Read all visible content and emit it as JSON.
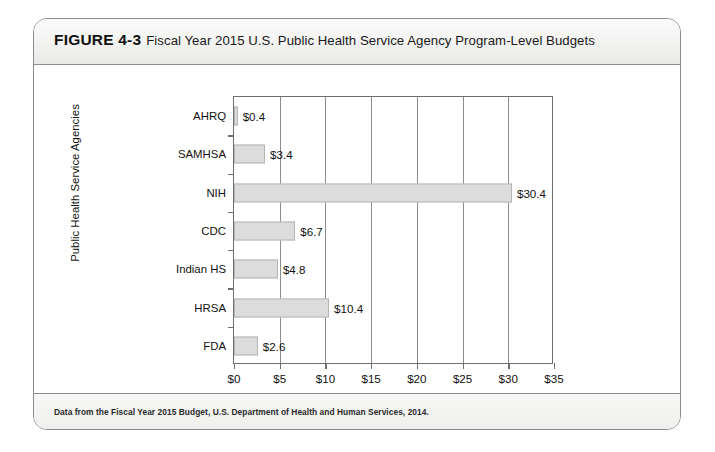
{
  "figure": {
    "number": "FIGURE 4-3",
    "caption": "Fiscal Year 2015 U.S. Public Health Service Agency Program-Level Budgets",
    "source_note": "Data from the Fiscal Year 2015 Budget, U.S. Department of Health and Human Services, 2014."
  },
  "colors": {
    "bar_fill": "#dcdcdc",
    "bar_border": "#b5b5b5",
    "axis": "#6f6f6f",
    "gridline": "#8c8c8c",
    "frame": "#8d8d8d"
  },
  "chart_data": {
    "type": "bar",
    "orientation": "horizontal",
    "title": "Fiscal Year 2015 U.S. Public Health Service Agency Program-Level Budgets",
    "xlabel": "Billions",
    "ylabel": "Public Health Service Agencies",
    "categories": [
      "AHRQ",
      "SAMHSA",
      "NIH",
      "CDC",
      "Indian HS",
      "HRSA",
      "FDA"
    ],
    "values": [
      0.4,
      3.4,
      30.4,
      6.7,
      4.8,
      10.4,
      2.6
    ],
    "data_labels": [
      "$0.4",
      "$3.4",
      "$30.4",
      "$6.7",
      "$4.8",
      "$10.4",
      "$2.6"
    ],
    "xlim": [
      0,
      35
    ],
    "xticks": [
      0,
      5,
      10,
      15,
      20,
      25,
      30,
      35
    ],
    "xticklabels": [
      "$0",
      "$5",
      "$10",
      "$15",
      "$20",
      "$25",
      "$30",
      "$35"
    ],
    "grid": "vertical",
    "legend": null
  }
}
